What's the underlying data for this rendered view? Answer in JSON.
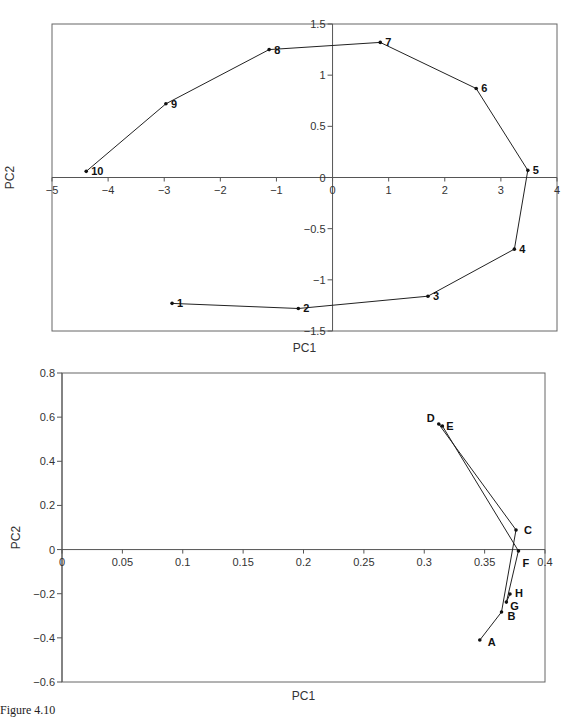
{
  "chart_data": [
    {
      "type": "line",
      "title": "",
      "xlabel": "PC1",
      "ylabel": "PC2",
      "xlim": [
        -5,
        4
      ],
      "ylim": [
        -1.5,
        1.5
      ],
      "xticks": [
        "-5",
        "-4",
        "-3",
        "-2",
        "-1",
        "0",
        "1",
        "2",
        "3",
        "4"
      ],
      "yticks": [
        "1.5",
        "1",
        "0.5",
        "0",
        "-0.5",
        "-1",
        "-1.5"
      ],
      "grid": false,
      "legend": null,
      "points": [
        {
          "label": "1",
          "x": -2.86,
          "y": -1.23
        },
        {
          "label": "2",
          "x": -0.61,
          "y": -1.28
        },
        {
          "label": "3",
          "x": 1.7,
          "y": -1.16
        },
        {
          "label": "4",
          "x": 3.24,
          "y": -0.7
        },
        {
          "label": "5",
          "x": 3.48,
          "y": 0.07
        },
        {
          "label": "6",
          "x": 2.56,
          "y": 0.87
        },
        {
          "label": "7",
          "x": 0.85,
          "y": 1.32
        },
        {
          "label": "8",
          "x": -1.13,
          "y": 1.25
        },
        {
          "label": "9",
          "x": -2.97,
          "y": 0.72
        },
        {
          "label": "10",
          "x": -4.39,
          "y": 0.06
        }
      ]
    },
    {
      "type": "line",
      "title": "",
      "xlabel": "PC1",
      "ylabel": "PC2",
      "xlim": [
        0,
        0.4
      ],
      "ylim": [
        -0.6,
        0.8
      ],
      "xticks": [
        "0",
        "0.05",
        "0.1",
        "0.15",
        "0.2",
        "0.25",
        "0.3",
        "0.35",
        "0.4"
      ],
      "yticks": [
        "0.8",
        "0.6",
        "0.4",
        "0.2",
        "0",
        "-0.2",
        "-0.4",
        "-0.6"
      ],
      "grid": false,
      "legend": null,
      "points": [
        {
          "label": "A",
          "x": 0.346,
          "y": -0.41
        },
        {
          "label": "B",
          "x": 0.364,
          "y": -0.283
        },
        {
          "label": "C",
          "x": 0.376,
          "y": 0.089
        },
        {
          "label": "D",
          "x": 0.312,
          "y": 0.569
        },
        {
          "label": "E",
          "x": 0.315,
          "y": 0.56
        },
        {
          "label": "F",
          "x": 0.378,
          "y": -0.006
        },
        {
          "label": "G",
          "x": 0.368,
          "y": -0.238
        },
        {
          "label": "H",
          "x": 0.371,
          "y": -0.201
        }
      ]
    }
  ],
  "caption": "Figure 4.10"
}
